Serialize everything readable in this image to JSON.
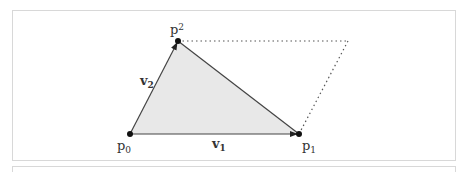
{
  "diagram": {
    "points": {
      "p0": {
        "label": "p",
        "sub": "0",
        "x": 130,
        "y": 134
      },
      "p1": {
        "label": "p",
        "sub": "1",
        "x": 299,
        "y": 134
      },
      "p2": {
        "label": "p",
        "sub": "2",
        "x": 178,
        "y": 41
      },
      "p3": {
        "x": 348,
        "y": 41
      }
    },
    "vectors": {
      "v1": {
        "label": "v",
        "sub": "1",
        "from": "p0",
        "to": "p1"
      },
      "v2": {
        "label": "v",
        "sub": "2",
        "from": "p0",
        "to": "p2"
      }
    },
    "colors": {
      "fill": "#e8e8e8",
      "stroke": "#444444",
      "point": "#111111",
      "dotted": "#555555",
      "frame": "#d8d8d8"
    }
  }
}
